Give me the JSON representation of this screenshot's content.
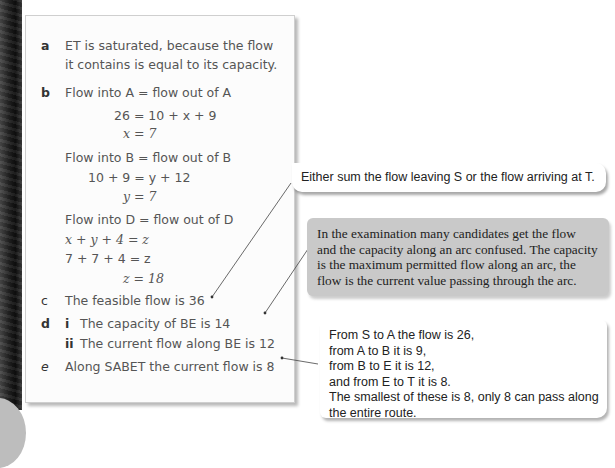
{
  "panel": {
    "a": {
      "label": "a",
      "lines": [
        "ET is saturated, because the flow",
        "it contains is equal to its capacity."
      ]
    },
    "b": {
      "label": "b",
      "line1": "Flow into A = flow out of A",
      "eq1": "26 = 10 + x + 9",
      "eq2": "x = 7",
      "line2": "Flow into B = flow out of B",
      "eq3": "10 + 9 = y + 12",
      "eq4": "y = 7",
      "line3": "Flow into D = flow out of D",
      "eq5": "x + y + 4 = z",
      "eq6": "7 + 7 + 4 = z",
      "eq7": "z = 18"
    },
    "c": {
      "label": "c",
      "text": "The feasible flow is 36"
    },
    "d": {
      "label": "d",
      "i_label": "i",
      "i_text": "The capacity of BE is 14",
      "ii_label": "ii",
      "ii_text": "The current flow along BE is 12"
    },
    "e": {
      "label": "e",
      "text": "Along SABET the current flow is 8"
    }
  },
  "callouts": {
    "c1": "Either sum the flow leaving S or the flow arriving at T.",
    "c2": [
      "In the examination many candidates get the flow",
      "and the capacity along an arc confused. The capacity",
      "is the maximum permitted flow along an arc, the",
      "flow is the current value passing through the arc."
    ],
    "c3": [
      "From S to A the flow is 26,",
      "from A to B it is 9,",
      "from B to E it is 12,",
      "and from E to T it is 8.",
      "The smallest of these is 8, only 8 can pass along",
      "the entire route."
    ]
  },
  "colors": {
    "callout_gray": "#c9c9c9",
    "text_gray": "#555555"
  }
}
